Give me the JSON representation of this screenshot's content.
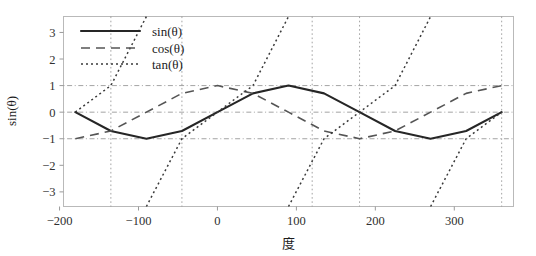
{
  "chart_data": {
    "type": "line",
    "title": "",
    "xlabel": "度",
    "ylabel": "sin(θ)",
    "xlim": [
      -195,
      375
    ],
    "ylim": [
      -3.55,
      3.6
    ],
    "xticks": [
      -200,
      -100,
      0,
      100,
      200,
      300
    ],
    "xtick_labels": [
      "−200",
      "−100",
      "0",
      "100",
      "200",
      "300"
    ],
    "yticks": [
      3,
      2,
      1,
      0,
      -1,
      -2,
      -3
    ],
    "ytick_labels": [
      "3",
      "2",
      "1",
      "0",
      "−1",
      "−2",
      "−3"
    ],
    "grid": true,
    "gridlines_y": [
      1,
      0,
      -1
    ],
    "gridlines_x_asymptotes": [
      -135,
      -45,
      120,
      180,
      360
    ],
    "legend_position": "upper-left",
    "x": [
      -180,
      -135,
      -90,
      -45,
      0,
      45,
      90,
      135,
      180,
      225,
      270,
      315,
      360
    ],
    "series": [
      {
        "name": "sin(θ)",
        "label": "sin(θ)",
        "style": "solid",
        "color": "#262626",
        "values": [
          0,
          -0.707,
          -1,
          -0.707,
          0,
          0.707,
          1,
          0.707,
          0,
          -0.707,
          -1,
          -0.707,
          0
        ]
      },
      {
        "name": "cos(θ)",
        "label": "cos(θ)",
        "style": "dashed",
        "color": "#555555",
        "values": [
          -1,
          -0.707,
          0,
          0.707,
          1,
          0.707,
          0,
          -0.707,
          -1,
          -0.707,
          0,
          0.707,
          1
        ]
      },
      {
        "name": "tan(θ)",
        "label": "tan(θ)",
        "style": "dotted",
        "color": "#3a3a3a",
        "values": [
          0,
          1,
          null,
          -1,
          0,
          1,
          null,
          -1,
          0,
          1,
          null,
          -1,
          0
        ]
      }
    ]
  },
  "axes": {
    "ylabel": "sin(θ)",
    "xlabel": "度"
  },
  "legend": {
    "entries": [
      {
        "label": "sin(θ)",
        "style": "solid"
      },
      {
        "label": "cos(θ)",
        "style": "dashed"
      },
      {
        "label": "tan(θ)",
        "style": "dotted"
      }
    ]
  },
  "ticks": {
    "x": [
      "−200",
      "−100",
      "0",
      "100",
      "200",
      "300"
    ],
    "y": [
      "3",
      "2",
      "1",
      "0",
      "−1",
      "−2",
      "−3"
    ]
  }
}
